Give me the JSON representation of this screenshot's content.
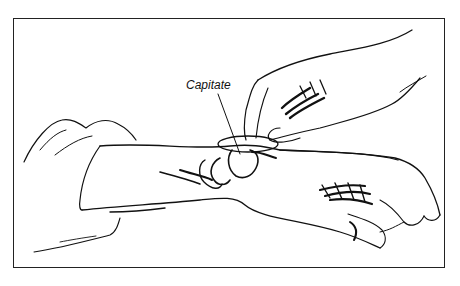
{
  "figure": {
    "label": "Capitate",
    "border_color": "#222222",
    "line_color": "#111111"
  }
}
